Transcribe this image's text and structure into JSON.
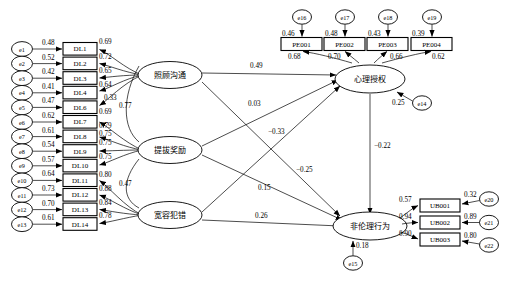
{
  "diagram": {
    "type": "structural-equation-model",
    "arrow_marker": "filled-triangle"
  },
  "left_errors": [
    {
      "id": "e1",
      "label": "e1",
      "value": "0.48"
    },
    {
      "id": "e2",
      "label": "e2",
      "value": "0.52"
    },
    {
      "id": "e3",
      "label": "e3",
      "value": "0.42"
    },
    {
      "id": "e4",
      "label": "e4",
      "value": "0.41"
    },
    {
      "id": "e5",
      "label": "e5",
      "value": "0.47"
    },
    {
      "id": "e6",
      "label": "e6",
      "value": "0.62"
    },
    {
      "id": "e7",
      "label": "e7",
      "value": "0.61"
    },
    {
      "id": "e8",
      "label": "e8",
      "value": "0.54"
    },
    {
      "id": "e9",
      "label": "e9",
      "value": "0.57"
    },
    {
      "id": "e10",
      "label": "e10",
      "value": "0.64"
    },
    {
      "id": "e11",
      "label": "e11",
      "value": "0.73"
    },
    {
      "id": "e12",
      "label": "e12",
      "value": "0.70"
    },
    {
      "id": "e13",
      "label": "e13",
      "value": "0.61"
    }
  ],
  "indicators_dl": [
    {
      "id": "DL1",
      "label": "DL1",
      "loading": "0.69"
    },
    {
      "id": "DL2",
      "label": "DL2",
      "loading": "0.72"
    },
    {
      "id": "DL3",
      "label": "DL3",
      "loading": "0.65"
    },
    {
      "id": "DL4",
      "label": "DL4",
      "loading": "0.64"
    },
    {
      "id": "DL6",
      "label": "DL6",
      "loading": "0.69"
    },
    {
      "id": "DL7",
      "label": "DL7",
      "loading": "0.79"
    },
    {
      "id": "DL8",
      "label": "DL8",
      "loading": "0.75"
    },
    {
      "id": "DL9",
      "label": "DL9",
      "loading": "0.75"
    },
    {
      "id": "DL10",
      "label": "DL10",
      "loading": "0.75"
    },
    {
      "id": "DL11",
      "label": "DL11",
      "loading": "0.80"
    },
    {
      "id": "DL12",
      "label": "DL12",
      "loading": "0.88"
    },
    {
      "id": "DL13",
      "label": "DL13",
      "loading": "0.84"
    },
    {
      "id": "DL14",
      "label": "DL14",
      "loading": "0.78"
    }
  ],
  "extra_loading": {
    "value": "0.33"
  },
  "latents": {
    "f1": {
      "label": "照顾沟通"
    },
    "f2": {
      "label": "提拔奖励"
    },
    "f3": {
      "label": "宽容犯错"
    },
    "f4": {
      "label": "心理授权"
    },
    "f5": {
      "label": "非伦理行为"
    }
  },
  "covariances": [
    {
      "id": "cov-f1-f2",
      "value": "0.77"
    },
    {
      "id": "cov-f2-f3",
      "value": "0.47"
    }
  ],
  "top_errors": [
    {
      "id": "e16",
      "label": "e16",
      "value": "0.46"
    },
    {
      "id": "e17",
      "label": "e17",
      "value": "0.48"
    },
    {
      "id": "e18",
      "label": "e18",
      "value": "0.43"
    },
    {
      "id": "e19",
      "label": "e19",
      "value": "0.39"
    }
  ],
  "indicators_pe": [
    {
      "id": "PE001",
      "label": "PE001",
      "loading": "0.68"
    },
    {
      "id": "PE002",
      "label": "PE002",
      "loading": "0.70"
    },
    {
      "id": "PE003",
      "label": "PE003",
      "loading": "0.66"
    },
    {
      "id": "PE004",
      "label": "PE004",
      "loading": "0.62"
    }
  ],
  "right_errors": [
    {
      "id": "e20",
      "label": "e20",
      "value": "0.32"
    },
    {
      "id": "e21",
      "label": "e21",
      "value": "0.89"
    },
    {
      "id": "e22",
      "label": "e22",
      "value": "0.80"
    }
  ],
  "indicators_ub": [
    {
      "id": "UB001",
      "label": "UB001",
      "loading": "0.57"
    },
    {
      "id": "UB002",
      "label": "UB002",
      "loading": "0.94"
    },
    {
      "id": "UB003",
      "label": "UB003",
      "loading": "0.90"
    }
  ],
  "disturbances": [
    {
      "id": "e14",
      "label": "e14",
      "value": "0.25"
    },
    {
      "id": "e15",
      "label": "e15",
      "value": "0.18"
    }
  ],
  "paths": [
    {
      "id": "p-f1-f4",
      "from": "照顾沟通",
      "to": "心理授权",
      "value": "0.49"
    },
    {
      "id": "p-f2-f4",
      "from": "提拔奖励",
      "to": "心理授权",
      "value": "0.03"
    },
    {
      "id": "p-f3-f4",
      "from": "宽容犯错",
      "to": "心理授权",
      "value": "0.15"
    },
    {
      "id": "p-f1-f5",
      "from": "照顾沟通",
      "to": "非伦理行为",
      "value": "−0.33"
    },
    {
      "id": "p-f2-f5",
      "from": "提拔奖励",
      "to": "非伦理行为",
      "value": "−0.25"
    },
    {
      "id": "p-f3-f5",
      "from": "宽容犯错",
      "to": "非伦理行为",
      "value": "0.26"
    },
    {
      "id": "p-f4-f5",
      "from": "心理授权",
      "to": "非伦理行为",
      "value": "−0.22"
    }
  ]
}
